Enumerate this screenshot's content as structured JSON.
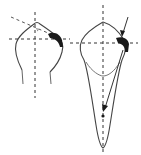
{
  "diagram": {
    "type": "tooth-outline-illustration",
    "colors": {
      "outline": "#444444",
      "dashed_axis": "#333333",
      "mark": "#1a1a1a",
      "background": "#ffffff"
    },
    "figures": [
      {
        "id": "left-tooth",
        "description": "Crown outline (facial view) with dashed vertical and horizontal axes, an angled dashed line, and a dark curved mark at the incisal-distal corner"
      },
      {
        "id": "right-tooth",
        "description": "Full tooth outline with root (proximal view), dashed vertical and horizontal axes, dark mark at crown edge, force arrow from upper right and arrow pointing toward root along the long axis"
      }
    ]
  }
}
